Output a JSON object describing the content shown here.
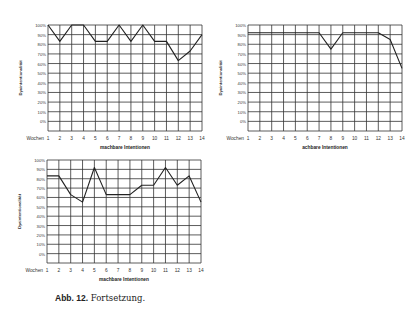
{
  "caption": {
    "label": "Abb. 12.",
    "text": "Fortsetzung."
  },
  "chart_data": [
    {
      "type": "line",
      "title": "",
      "xlabel": "machbare Intentionen",
      "ylabel": "Dyaintentionalität",
      "x_prefix": "Wochen",
      "x": [
        1,
        2,
        3,
        4,
        5,
        6,
        7,
        8,
        9,
        10,
        11,
        12,
        13,
        14
      ],
      "y_ticks": [
        "100%",
        "90%",
        "80%",
        "70%",
        "60%",
        "50%",
        "40%",
        "30%",
        "20%",
        "10%",
        "0%"
      ],
      "ylim": [
        0,
        100
      ],
      "grid": true,
      "series": [
        {
          "name": "machbare Intentionen",
          "values": [
            100,
            83,
            100,
            100,
            83,
            83,
            100,
            83,
            100,
            83,
            83,
            63,
            73,
            90
          ]
        }
      ]
    },
    {
      "type": "line",
      "title": "",
      "xlabel": "achbare Intentionen",
      "ylabel": "Dyaintentionalität",
      "x_prefix": "Wochen",
      "x": [
        1,
        2,
        3,
        4,
        5,
        6,
        7,
        8,
        9,
        10,
        11,
        12,
        13,
        14
      ],
      "y_ticks": [
        "100%",
        "90%",
        "80%",
        "70%",
        "60%",
        "50%",
        "40%",
        "30%",
        "20%",
        "10%",
        "0%"
      ],
      "ylim": [
        0,
        100
      ],
      "grid": true,
      "series": [
        {
          "name": "achbare Intentionen",
          "values": [
            92,
            92,
            92,
            92,
            92,
            92,
            92,
            75,
            92,
            92,
            92,
            92,
            85,
            55
          ]
        }
      ]
    },
    {
      "type": "line",
      "title": "",
      "xlabel": "machbare Intentionen",
      "ylabel": "Dyaintentionalität",
      "x_prefix": "Wochen",
      "x": [
        1,
        2,
        3,
        4,
        5,
        6,
        7,
        8,
        9,
        10,
        11,
        12,
        13,
        14
      ],
      "y_ticks": [
        "100%",
        "90%",
        "80%",
        "70%",
        "60%",
        "50%",
        "40%",
        "30%",
        "20%",
        "10%",
        "0%"
      ],
      "ylim": [
        0,
        100
      ],
      "grid": true,
      "series": [
        {
          "name": "machbare Intentionen",
          "values": [
            83,
            83,
            63,
            55,
            92,
            63,
            63,
            63,
            73,
            73,
            92,
            73,
            83,
            55
          ]
        }
      ]
    }
  ]
}
